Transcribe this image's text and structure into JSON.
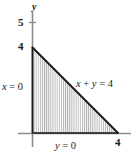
{
  "figure": {
    "type": "math-region-diagram",
    "axes": {
      "y_axis_label": "y",
      "y_ticks": [
        {
          "value": 5,
          "label": "5"
        },
        {
          "value": 4,
          "label": "4"
        }
      ],
      "x_ticks": [
        {
          "value": 4,
          "label": "4"
        }
      ]
    },
    "boundary_labels": {
      "left_edge": "x = 0",
      "bottom_edge": "y = 0",
      "hypotenuse": "x + y = 4"
    },
    "colors": {
      "axis": "#808080",
      "boundary": "#1a1a1a",
      "hatch": "#b3b3b3",
      "text": "#1a1a1a",
      "background": "#ffffff"
    }
  },
  "chart_data": {
    "type": "area",
    "title": "",
    "xlabel": "",
    "ylabel": "y",
    "xlim": [
      0,
      4.8
    ],
    "ylim": [
      0,
      5.6
    ],
    "grid": false,
    "legend": "none",
    "x_tick_labels": [
      "4"
    ],
    "x_tick_values": [
      4
    ],
    "y_tick_labels": [
      "5",
      "4"
    ],
    "y_tick_values": [
      5,
      4
    ],
    "series": [
      {
        "name": "x + y = 4",
        "x": [
          0,
          4
        ],
        "values": [
          4,
          0
        ],
        "fill": "vertical-hatch"
      }
    ],
    "region_vertices": [
      [
        0,
        0
      ],
      [
        0,
        4
      ],
      [
        4,
        0
      ]
    ],
    "annotations": [
      {
        "text": "x = 0",
        "x": 0,
        "y": 2.1,
        "placement": "left"
      },
      {
        "text": "y = 0",
        "x": 1.3,
        "y": 0,
        "placement": "below"
      },
      {
        "text": "x + y = 4",
        "x": 2.55,
        "y": 2.3,
        "placement": "above-right"
      },
      {
        "text": "y",
        "x": 0,
        "y": 5.55,
        "placement": "axis-top"
      }
    ]
  }
}
